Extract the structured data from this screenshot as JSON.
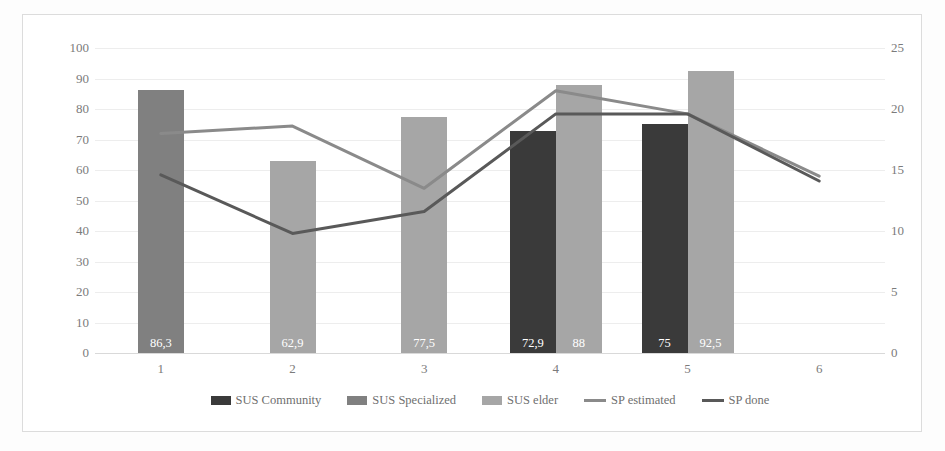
{
  "chart_data": {
    "type": "bar",
    "title": "",
    "xlabel": "",
    "ylabel": "",
    "categories": [
      "1",
      "2",
      "3",
      "4",
      "5",
      "6"
    ],
    "left_axis": {
      "ticks": [
        "0",
        "10",
        "20",
        "30",
        "40",
        "50",
        "60",
        "70",
        "80",
        "90",
        "100"
      ],
      "min": 0,
      "max": 100,
      "step": 10
    },
    "right_axis": {
      "ticks": [
        "0",
        "5",
        "10",
        "15",
        "20",
        "25"
      ],
      "min": 0,
      "max": 25,
      "step": 5
    },
    "grid": true,
    "legend_position": "bottom",
    "series": [
      {
        "name": "SUS Community",
        "kind": "bar",
        "axis": "left",
        "color": "#3a3a3a",
        "values": [
          null,
          null,
          null,
          72.9,
          75,
          null
        ],
        "labels": [
          "",
          "",
          "",
          "72,9",
          "75",
          ""
        ]
      },
      {
        "name": "SUS Specialized",
        "kind": "bar",
        "axis": "left",
        "color": "#808080",
        "values": [
          86.3,
          null,
          null,
          null,
          null,
          null
        ],
        "labels": [
          "86,3",
          "",
          "",
          "",
          "",
          ""
        ]
      },
      {
        "name": "SUS elder",
        "kind": "bar",
        "axis": "left",
        "color": "#a6a6a6",
        "values": [
          null,
          62.9,
          77.5,
          88,
          92.5,
          null
        ],
        "labels": [
          "",
          "62,9",
          "77,5",
          "88",
          "92,5",
          ""
        ]
      },
      {
        "name": "SP estimated",
        "kind": "line",
        "axis": "right",
        "color": "#8a8a8a",
        "values": [
          18,
          18.6,
          13.5,
          21.5,
          19.6,
          14.5
        ]
      },
      {
        "name": "SP done",
        "kind": "line",
        "axis": "right",
        "color": "#595959",
        "values": [
          14.6,
          9.8,
          11.6,
          19.6,
          19.6,
          14.1
        ]
      }
    ]
  },
  "legend": {
    "items": [
      {
        "label": "SUS Community",
        "marker": "box",
        "color": "#3a3a3a"
      },
      {
        "label": "SUS Specialized",
        "marker": "box",
        "color": "#808080"
      },
      {
        "label": "SUS elder",
        "marker": "box",
        "color": "#a6a6a6"
      },
      {
        "label": "SP estimated",
        "marker": "line",
        "color": "#8a8a8a"
      },
      {
        "label": "SP done",
        "marker": "line",
        "color": "#595959"
      }
    ]
  }
}
